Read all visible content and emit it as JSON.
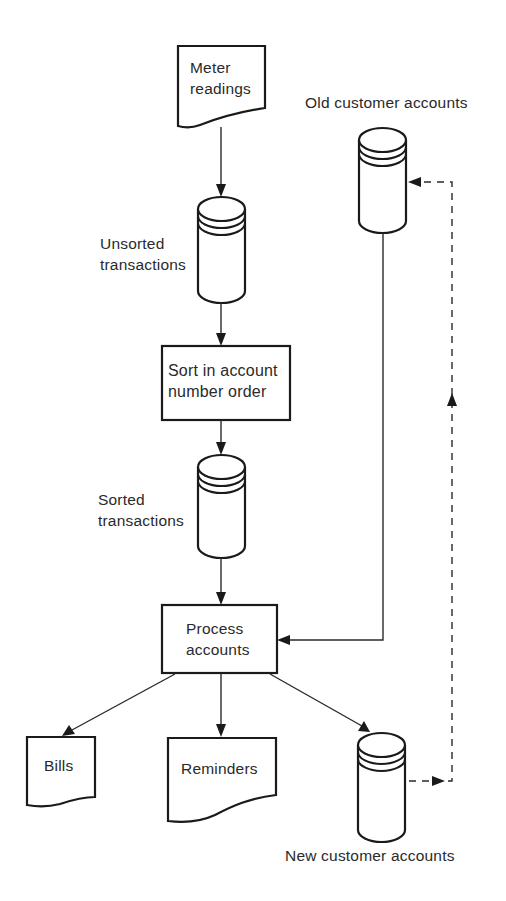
{
  "diagram": {
    "type": "system-flowchart",
    "nodes": {
      "meter_readings": {
        "shape": "document",
        "line1": "Meter",
        "line2": "readings"
      },
      "unsorted_transactions": {
        "shape": "disk-storage",
        "line1": "Unsorted",
        "line2": "transactions"
      },
      "sort_process": {
        "shape": "process",
        "line1": "Sort in account",
        "line2": "number order"
      },
      "sorted_transactions": {
        "shape": "disk-storage",
        "line1": "Sorted",
        "line2": "transactions"
      },
      "process_accounts": {
        "shape": "process",
        "line1": "Process",
        "line2": "accounts"
      },
      "old_customer_accounts": {
        "shape": "disk-storage",
        "label": "Old customer accounts"
      },
      "bills": {
        "shape": "document",
        "label": "Bills"
      },
      "reminders": {
        "shape": "document",
        "label": "Reminders"
      },
      "new_customer_accounts": {
        "shape": "disk-storage",
        "label": "New customer accounts"
      }
    },
    "edges": [
      {
        "from": "meter_readings",
        "to": "unsorted_transactions",
        "style": "solid"
      },
      {
        "from": "unsorted_transactions",
        "to": "sort_process",
        "style": "solid"
      },
      {
        "from": "sort_process",
        "to": "sorted_transactions",
        "style": "solid"
      },
      {
        "from": "sorted_transactions",
        "to": "process_accounts",
        "style": "solid"
      },
      {
        "from": "old_customer_accounts",
        "to": "process_accounts",
        "style": "solid"
      },
      {
        "from": "process_accounts",
        "to": "bills",
        "style": "solid"
      },
      {
        "from": "process_accounts",
        "to": "reminders",
        "style": "solid"
      },
      {
        "from": "process_accounts",
        "to": "new_customer_accounts",
        "style": "solid"
      },
      {
        "from": "new_customer_accounts",
        "to": "old_customer_accounts",
        "style": "dashed"
      }
    ]
  }
}
